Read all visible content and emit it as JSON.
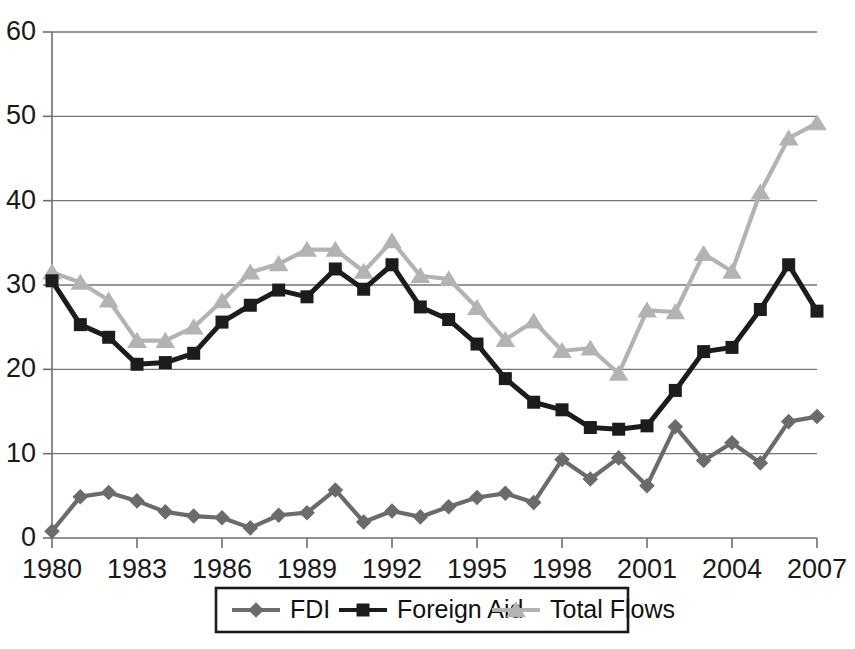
{
  "chart_data": {
    "type": "line",
    "title": "",
    "subtitle": "",
    "xlabel": "",
    "ylabel": "",
    "x": [
      1980,
      1981,
      1982,
      1983,
      1984,
      1985,
      1986,
      1987,
      1988,
      1989,
      1990,
      1991,
      1992,
      1993,
      1994,
      1995,
      1996,
      1997,
      1998,
      1999,
      2000,
      2001,
      2002,
      2003,
      2004,
      2005,
      2006,
      2007
    ],
    "xlim": [
      1980,
      2007
    ],
    "ylim": [
      0,
      60
    ],
    "yticks": [
      0,
      10,
      20,
      30,
      40,
      50,
      60
    ],
    "xticks": [
      1980,
      1983,
      1986,
      1989,
      1992,
      1995,
      1998,
      2001,
      2004,
      2007
    ],
    "xtick_labels": [
      "1980",
      "1983",
      "1986",
      "1989",
      "1992",
      "1995",
      "1998",
      "2001",
      "2004",
      "2007"
    ],
    "ytick_labels": [
      "0",
      "10",
      "20",
      "30",
      "40",
      "50",
      "60"
    ],
    "grid": "horizontal",
    "legend_position": "bottom",
    "series": [
      {
        "name": "FDI",
        "marker": "diamond",
        "color": "#6b6b6b",
        "values": [
          0.8,
          4.9,
          5.4,
          4.4,
          3.1,
          2.6,
          2.4,
          1.2,
          2.7,
          3.0,
          5.7,
          1.9,
          3.2,
          2.5,
          3.7,
          4.8,
          5.3,
          4.2,
          9.3,
          7.0,
          9.5,
          6.2,
          13.2,
          9.2,
          11.3,
          8.9,
          13.8,
          14.4
        ]
      },
      {
        "name": "Foreign Aid",
        "marker": "square",
        "color": "#1c1c1c",
        "values": [
          30.5,
          25.3,
          23.8,
          20.6,
          20.8,
          21.9,
          25.6,
          27.6,
          29.4,
          28.6,
          31.9,
          29.5,
          32.4,
          27.4,
          25.9,
          23.0,
          18.9,
          16.1,
          15.2,
          13.1,
          12.9,
          13.3,
          17.5,
          22.1,
          22.6,
          27.1,
          32.4,
          26.9
        ]
      },
      {
        "name": "Total Flows",
        "marker": "triangle",
        "color": "#b3b3b3",
        "values": [
          31.5,
          30.3,
          28.2,
          23.4,
          23.4,
          25.0,
          28.1,
          31.5,
          32.5,
          34.2,
          34.2,
          31.6,
          35.2,
          31.1,
          30.7,
          27.3,
          23.5,
          25.7,
          22.2,
          22.5,
          19.5,
          27.0,
          26.8,
          33.7,
          31.6,
          41.0,
          47.4,
          49.2
        ]
      }
    ],
    "legend": [
      {
        "label": "FDI",
        "marker": "diamond",
        "color": "#6b6b6b"
      },
      {
        "label": "Foreign Aid",
        "marker": "square",
        "color": "#1c1c1c"
      },
      {
        "label": "Total Flows",
        "marker": "triangle",
        "color": "#b3b3b3"
      }
    ],
    "note_fdi_2007": 21.8
  }
}
